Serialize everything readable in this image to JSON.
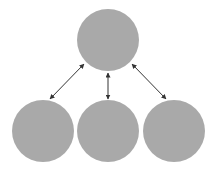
{
  "diagram": {
    "type": "hierarchy",
    "colors": {
      "node_fill": "#a9a9a9",
      "edge": "#333333",
      "background": "#ffffff"
    },
    "nodes": [
      {
        "id": "top",
        "cx": 108,
        "cy": 40,
        "r": 31,
        "label": ""
      },
      {
        "id": "bottom-left",
        "cx": 43,
        "cy": 131,
        "r": 31,
        "label": ""
      },
      {
        "id": "bottom-center",
        "cx": 108,
        "cy": 131,
        "r": 31,
        "label": ""
      },
      {
        "id": "bottom-right",
        "cx": 174,
        "cy": 131,
        "r": 31,
        "label": ""
      }
    ],
    "edges": [
      {
        "from": "top",
        "to": "bottom-left",
        "direction": "bidirectional"
      },
      {
        "from": "top",
        "to": "bottom-center",
        "direction": "bidirectional"
      },
      {
        "from": "top",
        "to": "bottom-right",
        "direction": "bidirectional"
      }
    ]
  }
}
